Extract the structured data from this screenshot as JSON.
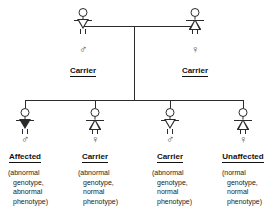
{
  "diagram": {
    "type": "pedigree-chart",
    "line_color": "#2b2b2b",
    "background_color": "#ffffff",
    "symbols": {
      "male": "♂",
      "female": "♀"
    }
  },
  "parents": [
    {
      "id": "father",
      "sex": "male",
      "sex_symbol": "♂",
      "body_shape": "triangle-down",
      "status_label": "Carrier"
    },
    {
      "id": "mother",
      "sex": "female",
      "sex_symbol": "♀",
      "body_shape": "triangle-up",
      "status_label": "Carrier"
    }
  ],
  "children": [
    {
      "id": "child-1",
      "sex": "male",
      "sex_symbol": "♂",
      "body_shape": "triangle-down",
      "filled": true,
      "status_label": "Affected",
      "genotype_lines": [
        "(abnormal",
        "genotype,",
        "abnormal",
        "phenotype)"
      ]
    },
    {
      "id": "child-2",
      "sex": "female",
      "sex_symbol": "♀",
      "body_shape": "triangle-up",
      "filled": false,
      "status_label": "Carrier",
      "genotype_lines": [
        "(abnormal",
        "genotype,",
        "normal",
        "phenotype)"
      ]
    },
    {
      "id": "child-3",
      "sex": "male",
      "sex_symbol": "♂",
      "body_shape": "triangle-down",
      "filled": false,
      "status_label": "Carrier",
      "genotype_lines": [
        "(abnormal",
        "genotype,",
        "normal",
        "phenotype)"
      ]
    },
    {
      "id": "child-4",
      "sex": "female",
      "sex_symbol": "♀",
      "body_shape": "triangle-up",
      "filled": false,
      "status_label": "Unaffected",
      "genotype_lines": [
        "(normal",
        "genotype,",
        "normal",
        "phenotype)"
      ]
    }
  ]
}
